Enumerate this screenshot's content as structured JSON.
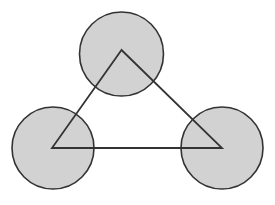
{
  "figure": {
    "title": "Three overlapping circles with inscribed triangle",
    "canvas": {
      "width": 275,
      "height": 205,
      "background_color": "#ffffff"
    },
    "style": {
      "circle_fill_color": "#d2d2d2",
      "circle_stroke_color": "#333333",
      "circle_stroke_width": 1.6,
      "triangle_fill": "none",
      "triangle_stroke_color": "#333333",
      "triangle_stroke_width": 1.8
    },
    "circles": [
      {
        "name": "top-circle",
        "label": "Top circle",
        "cx": 121.5,
        "cy": 54,
        "r": 42
      },
      {
        "name": "left-circle",
        "label": "Bottom-left circle",
        "cx": 53,
        "cy": 148,
        "r": 41
      },
      {
        "name": "right-circle",
        "label": "Bottom-right circle",
        "cx": 222,
        "cy": 148,
        "r": 41
      }
    ],
    "triangle": {
      "name": "connecting-triangle",
      "label": "Triangle joining circle centers",
      "points": "121.5,50 52,148 222,148",
      "vertices": [
        {
          "label": "apex",
          "x": 121.5,
          "y": 50
        },
        {
          "label": "bottom-left",
          "x": 52,
          "y": 148
        },
        {
          "label": "bottom-right",
          "x": 222,
          "y": 148
        }
      ]
    }
  }
}
